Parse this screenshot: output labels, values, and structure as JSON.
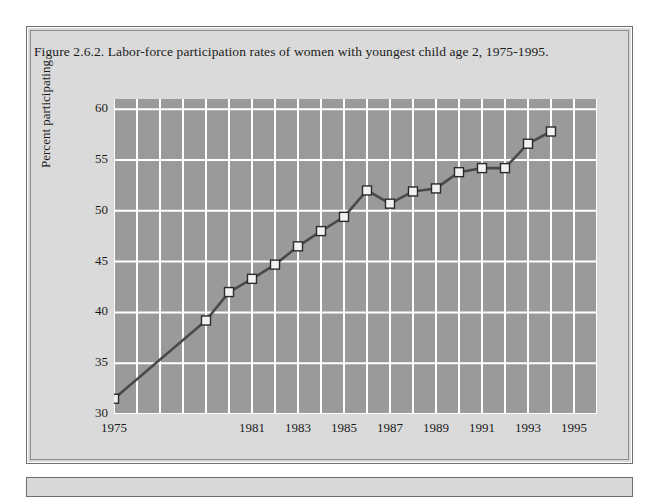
{
  "figure": {
    "caption": "Figure 2.6.2. Labor-force participation rates of women with youngest child age 2, 1975-1995."
  },
  "colors": {
    "page_background": "#ffffff",
    "box_background": "#d9d9d9",
    "box_border": "#6e6e6e",
    "plot_background": "#9a9a9a",
    "gridline": "#ffffff",
    "line": "#4a4a4a",
    "marker_fill": "#f2f2f2",
    "marker_stroke": "#2b2b2b",
    "text": "#1a1a1a"
  },
  "chart_data": {
    "type": "line",
    "title": "Figure 2.6.2. Labor-force participation rates of women with youngest child age 2, 1975-1995.",
    "xlabel": "",
    "ylabel": "Percent participating",
    "ylim": [
      30,
      61
    ],
    "xlim": [
      1975,
      1996
    ],
    "yticks": [
      30,
      35,
      40,
      45,
      50,
      55,
      60
    ],
    "ytick_labels": [
      "30",
      "35",
      "40",
      "45",
      "50",
      "55",
      "60"
    ],
    "xticks": [
      1975,
      1981,
      1983,
      1985,
      1987,
      1989,
      1991,
      1993,
      1995
    ],
    "xtick_labels": [
      "1975",
      "1981",
      "1983",
      "1985",
      "1987",
      "1989",
      "1991",
      "1993",
      "1995"
    ],
    "grid": true,
    "legend": null,
    "marker": "square",
    "x": [
      1975,
      1979,
      1980,
      1981,
      1982,
      1983,
      1984,
      1985,
      1986,
      1987,
      1988,
      1989,
      1990,
      1991,
      1992,
      1993,
      1994,
      1995
    ],
    "values": [
      31.5,
      39.2,
      42.0,
      43.3,
      44.7,
      46.5,
      48.0,
      49.4,
      52.0,
      50.7,
      51.9,
      52.2,
      53.8,
      54.2,
      54.2,
      56.6,
      57.8,
      57.8
    ],
    "series": [
      {
        "name": "Percent participating",
        "points": [
          {
            "x": 1975,
            "y": 31.5
          },
          {
            "x": 1979,
            "y": 39.2
          },
          {
            "x": 1980,
            "y": 42.0
          },
          {
            "x": 1981,
            "y": 43.3
          },
          {
            "x": 1982,
            "y": 44.7
          },
          {
            "x": 1983,
            "y": 46.5
          },
          {
            "x": 1984,
            "y": 48.0
          },
          {
            "x": 1985,
            "y": 49.4
          },
          {
            "x": 1986,
            "y": 52.0
          },
          {
            "x": 1987,
            "y": 50.7
          },
          {
            "x": 1988,
            "y": 51.9
          },
          {
            "x": 1989,
            "y": 52.2
          },
          {
            "x": 1990,
            "y": 53.8
          },
          {
            "x": 1991,
            "y": 54.2
          },
          {
            "x": 1992,
            "y": 54.2
          },
          {
            "x": 1993,
            "y": 56.6
          },
          {
            "x": 1994,
            "y": 57.8
          }
        ]
      }
    ],
    "gridline_count_x": 15
  }
}
